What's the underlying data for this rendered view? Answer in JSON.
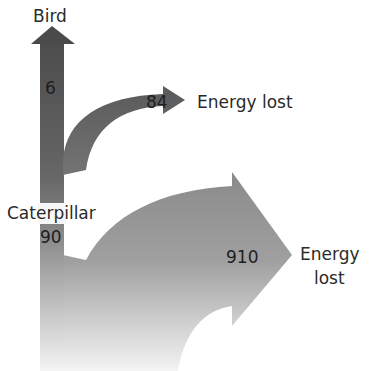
{
  "diagram": {
    "type": "energy-flow",
    "nodes": {
      "top": {
        "label": "Bird",
        "value": "6"
      },
      "source": {
        "label": "Caterpillar",
        "value": "90"
      },
      "loss_small": {
        "label": "Energy lost",
        "value": "84"
      },
      "loss_large": {
        "label_line1": "Energy",
        "label_line2": "lost",
        "value": "910"
      }
    },
    "colors": {
      "dark": "#505050",
      "mid": "#7a7a7a",
      "light": "#f2f2f2",
      "text": "#222222",
      "background": "#ffffff"
    }
  }
}
